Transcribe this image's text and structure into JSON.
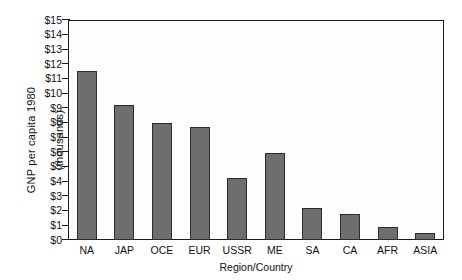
{
  "chart_data": {
    "type": "bar",
    "title": "",
    "subtitle": "",
    "xlabel": "Region/Country",
    "ylabel": "GNP per capita 1980\n(thousands)",
    "ylabel_line1": "GNP per capita 1980",
    "ylabel_line2": "(thousands)",
    "categories": [
      "NA",
      "JAP",
      "OCE",
      "EUR",
      "USSR",
      "ME",
      "SA",
      "CA",
      "AFR",
      "ASIA"
    ],
    "values": [
      11.5,
      9.2,
      8.0,
      7.7,
      4.2,
      5.9,
      2.2,
      1.8,
      0.9,
      0.45
    ],
    "ylim": [
      0,
      15
    ],
    "ytick_values": [
      0,
      1,
      2,
      3,
      4,
      5,
      6,
      7,
      8,
      9,
      10,
      11,
      12,
      13,
      14,
      15
    ],
    "ytick_labels": [
      "$0",
      "$1",
      "$2",
      "$3",
      "$4",
      "$5",
      "$6",
      "$7",
      "$8",
      "$9",
      "$10",
      "$11",
      "$12",
      "$13",
      "$14",
      "$15"
    ],
    "grid": false,
    "legend": "none",
    "series_name": "GNP per capita",
    "bar_color": "#6e6e6e",
    "bar_edge_color": "#2c2c2c",
    "axis_color": "#1a1a1a",
    "plot_background": "#fdfdfd"
  }
}
